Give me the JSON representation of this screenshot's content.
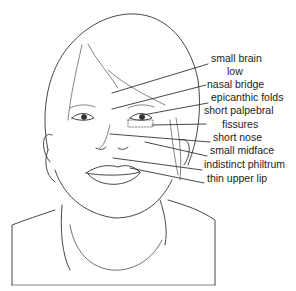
{
  "figure": {
    "line_color": "#333333",
    "labels": [
      {
        "text": "small brain",
        "x": 211,
        "y": 58
      },
      {
        "text": "low",
        "x": 227,
        "y": 71
      },
      {
        "text": "nasal bridge",
        "x": 207,
        "y": 84
      },
      {
        "text": "epicanthic folds",
        "x": 211,
        "y": 97
      },
      {
        "text": "short palpebral",
        "x": 204,
        "y": 110
      },
      {
        "text": "fissures",
        "x": 222,
        "y": 123
      },
      {
        "text": "short nose",
        "x": 213,
        "y": 137
      },
      {
        "text": "small midface",
        "x": 210,
        "y": 150
      },
      {
        "text": "indistinct philtrum",
        "x": 204,
        "y": 164
      },
      {
        "text": "thin upper lip",
        "x": 207,
        "y": 178
      }
    ]
  }
}
